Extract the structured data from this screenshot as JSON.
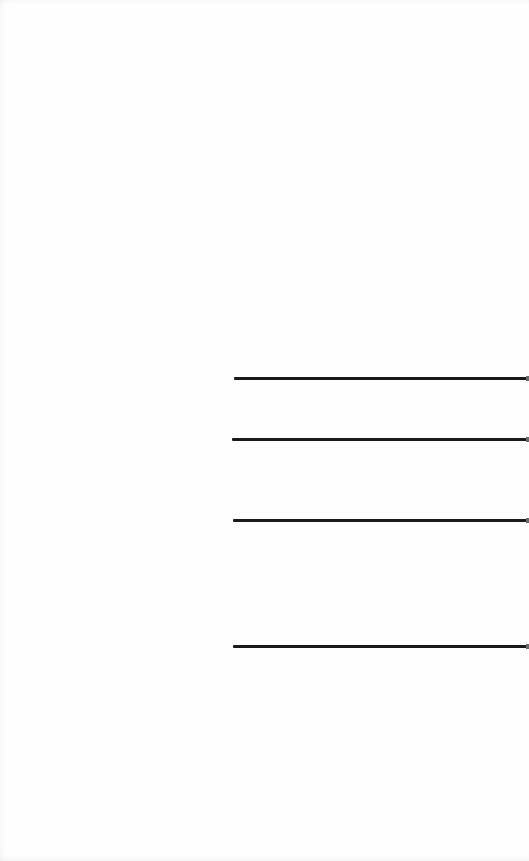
{
  "page": {
    "background": "#fefefe",
    "rule_color": "#1a1a1a",
    "rules": [
      {
        "name": "blank-line-1",
        "x": 234,
        "y": 377,
        "width": 295
      },
      {
        "name": "blank-line-2",
        "x": 232,
        "y": 438,
        "width": 297
      },
      {
        "name": "blank-line-3",
        "x": 233,
        "y": 519,
        "width": 296
      },
      {
        "name": "blank-line-4",
        "x": 233,
        "y": 645,
        "width": 296
      }
    ]
  }
}
